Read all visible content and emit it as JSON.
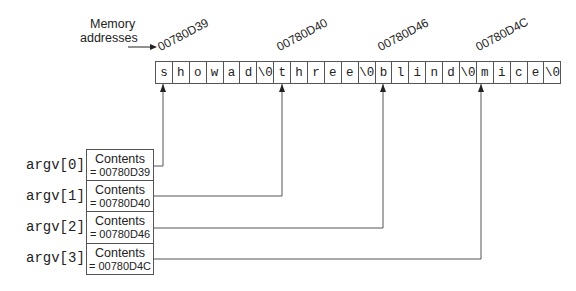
{
  "memory_label": {
    "line1": "Memory",
    "line2": "addresses"
  },
  "addresses": [
    "00780D39",
    "00780D40",
    "00780D46",
    "00780D4C"
  ],
  "cells": [
    "s",
    "h",
    "o",
    "w",
    "a",
    "d",
    "\\0",
    "t",
    "h",
    "r",
    "e",
    "e",
    "\\0",
    "b",
    "l",
    "i",
    "n",
    "d",
    "\\0",
    "m",
    "i",
    "c",
    "e",
    "\\0"
  ],
  "argv": [
    {
      "label": "argv[0]",
      "contents": "Contents",
      "value": "= 00780D39"
    },
    {
      "label": "argv[1]",
      "contents": "Contents",
      "value": "= 00780D40"
    },
    {
      "label": "argv[2]",
      "contents": "Contents",
      "value": "= 00780D46"
    },
    {
      "label": "argv[3]",
      "contents": "Contents",
      "value": "= 00780D4C"
    }
  ],
  "colors": {
    "line": "#555555",
    "text": "#222222"
  }
}
